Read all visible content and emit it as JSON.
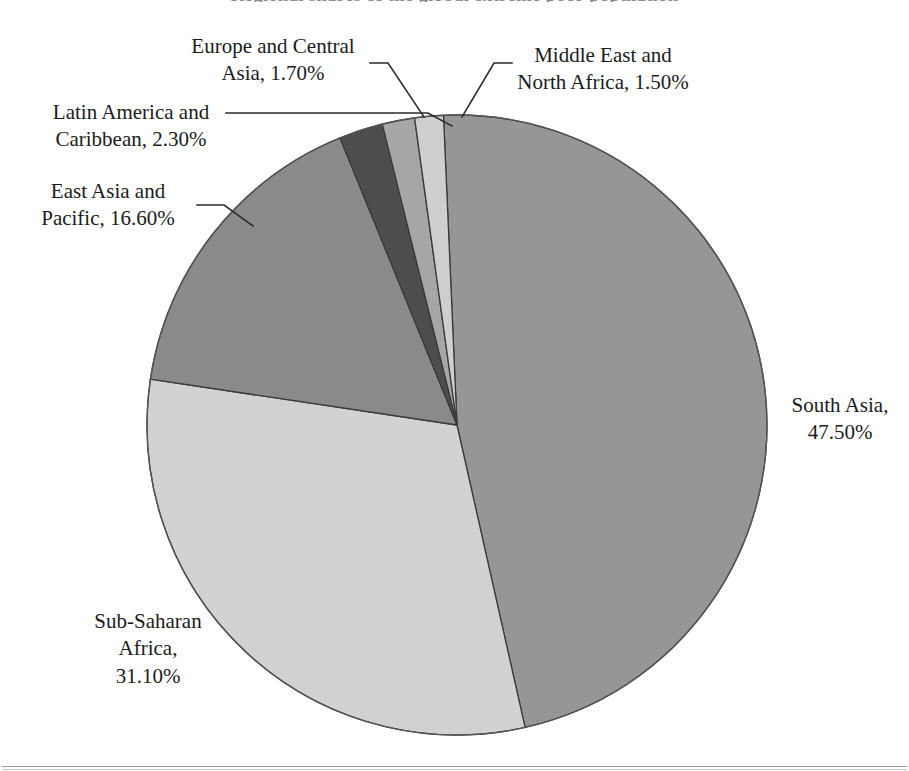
{
  "figure": {
    "title_partial": "Regional shares of the global extreme poor population",
    "bottom_rule": true
  },
  "chart_data": {
    "type": "pie",
    "title": "",
    "subtitle": "",
    "xlabel": "",
    "ylabel": "",
    "legend_position": "callout-labels",
    "grid": false,
    "value_suffix": "%",
    "start_angle_deg": -2.5,
    "direction": "clockwise",
    "categories": [
      "South Asia",
      "Sub-Saharan Africa",
      "East Asia and Pacific",
      "Latin America and Caribbean",
      "Europe and Central Asia",
      "Middle East and North Africa"
    ],
    "values": [
      47.5,
      31.1,
      16.6,
      2.3,
      1.7,
      1.5
    ],
    "value_labels": [
      "47.50%",
      "31.10%",
      "16.60%",
      "2.30%",
      "1.70%",
      "1.50%"
    ],
    "colors": [
      "#969696",
      "#d2d2d2",
      "#8a8a8a",
      "#4d4d4d",
      "#a6a6a6",
      "#cfcfcf"
    ],
    "slice_border_color": "#3a3a3a",
    "slices": [
      {
        "name": "South Asia",
        "value": 47.5,
        "value_label": "47.50%",
        "color": "#969696",
        "label_text": "South Asia,\n47.50%",
        "leader_line": false
      },
      {
        "name": "Sub-Saharan Africa",
        "value": 31.1,
        "value_label": "31.10%",
        "color": "#d2d2d2",
        "label_text": "Sub-Saharan\nAfrica,\n31.10%",
        "leader_line": false
      },
      {
        "name": "East Asia and Pacific",
        "value": 16.6,
        "value_label": "16.60%",
        "color": "#8a8a8a",
        "label_text": "East Asia and\nPacific, 16.60%",
        "leader_line": true
      },
      {
        "name": "Latin America and Caribbean",
        "value": 2.3,
        "value_label": "2.30%",
        "color": "#4d4d4d",
        "label_text": "Latin America and\nCaribbean, 2.30%",
        "leader_line": true
      },
      {
        "name": "Europe and Central Asia",
        "value": 1.7,
        "value_label": "1.70%",
        "color": "#a6a6a6",
        "label_text": "Europe and Central\nAsia, 1.70%",
        "leader_line": true
      },
      {
        "name": "Middle East and North Africa",
        "value": 1.5,
        "value_label": "1.50%",
        "color": "#cfcfcf",
        "label_text": "Middle East and\nNorth Africa, 1.50%",
        "leader_line": true
      }
    ],
    "geometry": {
      "center_x": 457,
      "center_y": 425,
      "radius": 310
    }
  }
}
